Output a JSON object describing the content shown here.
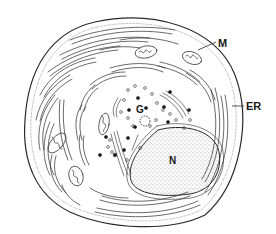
{
  "figure": {
    "labels": {
      "mitochondrion": "M",
      "endoplasmic_reticulum": "ER",
      "golgi": "G",
      "nucleus": "N"
    },
    "colors": {
      "ink": "#2a2a2a",
      "background": "#ffffff"
    }
  }
}
